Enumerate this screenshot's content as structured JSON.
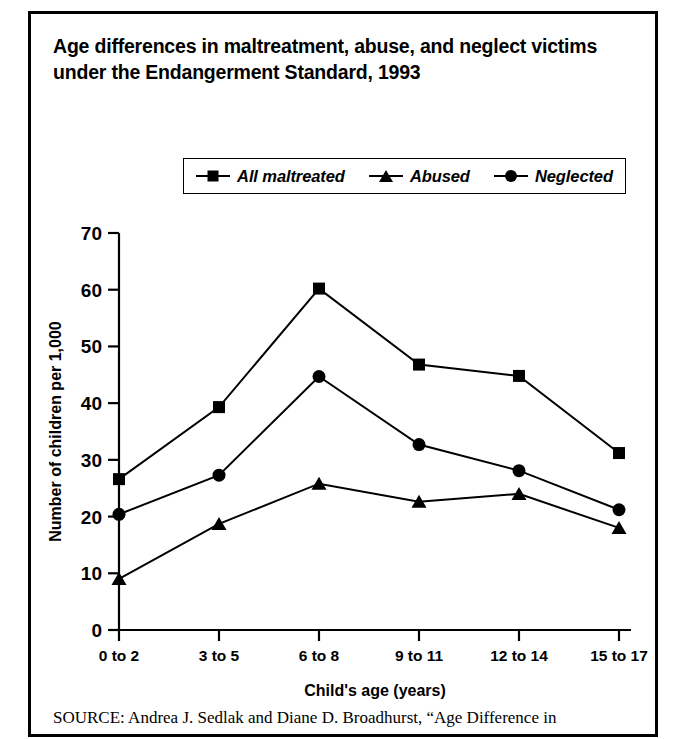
{
  "figure": {
    "title": "Age differences in maltreatment, abuse, and neglect victims under the Endangerment Standard, 1993",
    "source_label": "SOURCE:",
    "source_text": "Andrea J. Sedlak and Diane D. Broadhurst, “Age Difference in",
    "frame_color": "#000000",
    "ink_color": "#000000",
    "background_color": "#ffffff"
  },
  "chart_data": {
    "type": "line",
    "title": "Age differences in maltreatment, abuse, and neglect victims under the Endangerment Standard, 1993",
    "xlabel": "Child's age (years)",
    "ylabel": "Number of children per 1,000",
    "categories": [
      "0 to 2",
      "3 to 5",
      "6 to 8",
      "9 to 11",
      "12 to 14",
      "15 to 17"
    ],
    "ylim": [
      0,
      70
    ],
    "yticks": [
      0,
      10,
      20,
      30,
      40,
      50,
      60,
      70
    ],
    "grid": false,
    "legend_position": "top-center",
    "series": [
      {
        "name": "All maltreated",
        "marker": "square",
        "values": [
          26.6,
          39.3,
          60.2,
          46.8,
          44.8,
          31.2
        ]
      },
      {
        "name": "Abused",
        "marker": "triangle",
        "values": [
          9.0,
          18.7,
          25.8,
          22.6,
          24.0,
          18.0
        ]
      },
      {
        "name": "Neglected",
        "marker": "circle",
        "values": [
          20.4,
          27.3,
          44.7,
          32.7,
          28.1,
          21.2
        ]
      }
    ]
  }
}
